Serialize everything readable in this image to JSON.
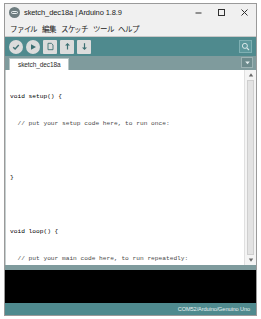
{
  "window": {
    "title": "sketch_dec18a | Arduino 1.8.9",
    "app_icon": "arduino-logo-icon",
    "controls": {
      "minimize_label": "─",
      "maximize_label": "□",
      "close_label": "✕"
    }
  },
  "menu": {
    "items": [
      {
        "label": "ファイル",
        "name": "menu-file"
      },
      {
        "label": "編集",
        "name": "menu-edit"
      },
      {
        "label": "スケッチ",
        "name": "menu-sketch"
      },
      {
        "label": "ツール",
        "name": "menu-tools"
      },
      {
        "label": "ヘルプ",
        "name": "menu-help"
      }
    ]
  },
  "toolbar": {
    "background": "#4f8a8e",
    "buttons": [
      {
        "name": "verify-button",
        "icon": "checkmark-icon",
        "tooltip": "検証・コンパイル"
      },
      {
        "name": "upload-button",
        "icon": "arrow-right-icon",
        "tooltip": "マイコンボードに書き込む"
      },
      {
        "name": "new-button",
        "icon": "new-document-icon",
        "tooltip": "新規ファイル"
      },
      {
        "name": "open-button",
        "icon": "arrow-up-icon",
        "tooltip": "開く"
      },
      {
        "name": "save-button",
        "icon": "arrow-down-icon",
        "tooltip": "保存"
      }
    ],
    "serial_monitor": {
      "name": "serial-monitor-button",
      "icon": "magnifier-icon"
    }
  },
  "tabs": {
    "background": "#7f9b9d",
    "items": [
      {
        "label": "sketch_dec18a",
        "name": "sketch-tab",
        "active": true
      }
    ],
    "menu_button": {
      "name": "tab-menu-button",
      "icon": "chevron-down-icon"
    }
  },
  "editor": {
    "lines": [
      {
        "text": "void setup() {",
        "type": "code"
      },
      {
        "text": "  // put your setup code here, to run once:",
        "type": "comment"
      },
      {
        "text": "",
        "type": "blank"
      },
      {
        "text": "}",
        "type": "code"
      },
      {
        "text": "",
        "type": "blank"
      },
      {
        "text": "void loop() {",
        "type": "code"
      },
      {
        "text": "  // put your main code here, to run repeatedly:",
        "type": "comment"
      },
      {
        "text": "",
        "type": "blank"
      },
      {
        "text": "}",
        "type": "code"
      }
    ],
    "scrollbar": {
      "up_arrow": "▲",
      "down_arrow": "▼",
      "thumb_name": "scrollbar-thumb"
    }
  },
  "console": {
    "text": "",
    "background": "#000000"
  },
  "status": {
    "text": "COM52/Arduino/Genuino Uno",
    "background": "#4f8a8e"
  }
}
